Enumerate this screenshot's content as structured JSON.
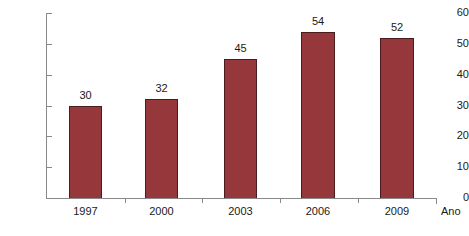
{
  "chart_data": {
    "type": "bar",
    "title": "",
    "subtitle": "",
    "xlabel": "Ano",
    "ylabel": "",
    "categories": [
      "1997",
      "2000",
      "2003",
      "2006",
      "2009"
    ],
    "values": [
      30,
      32,
      45,
      54,
      52
    ],
    "data_labels": [
      "30",
      "32",
      "45",
      "54",
      "52"
    ],
    "ylim": [
      0,
      60
    ],
    "ytick_labels": [
      "0",
      "10",
      "20",
      "30",
      "40",
      "50",
      "60"
    ],
    "ytick_values": [
      0,
      10,
      20,
      30,
      40,
      50,
      60
    ],
    "grid": false,
    "legend": false,
    "legend_position": "none",
    "series": [
      {
        "name": "",
        "values": [
          30,
          32,
          45,
          54,
          52
        ]
      }
    ],
    "colors": {
      "bar_fill": "#96373c",
      "bar_border": "#4a1c1f",
      "axis": "#8a8a8a",
      "text": "#1a1a1a",
      "background": "#ffffff"
    }
  }
}
